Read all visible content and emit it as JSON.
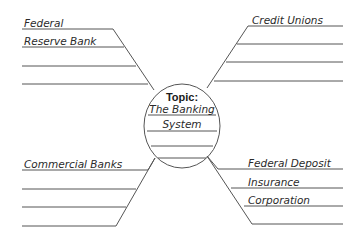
{
  "center": {
    "heading": "Topic:",
    "lines": [
      "The Banking",
      "System",
      "",
      ""
    ]
  },
  "branches": {
    "top_left": {
      "lines": [
        "Federal",
        "Reserve Bank",
        "",
        ""
      ]
    },
    "top_right": {
      "lines": [
        "Credit Unions",
        "",
        "",
        ""
      ]
    },
    "bottom_left": {
      "lines": [
        "Commercial Banks",
        "",
        "",
        ""
      ]
    },
    "bottom_right": {
      "lines": [
        "Federal Deposit",
        "Insurance",
        "Corporation",
        ""
      ]
    }
  },
  "colors": {
    "line": "#555555",
    "text": "#2a2a2a",
    "background": "#ffffff"
  }
}
